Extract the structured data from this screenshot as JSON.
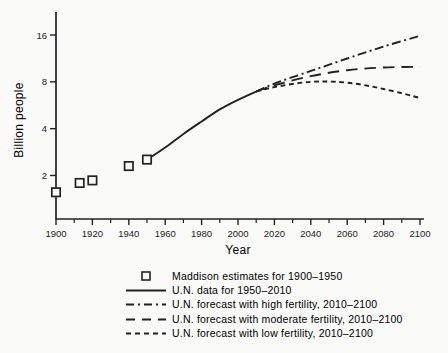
{
  "colors": {
    "background": "#fafaf8",
    "ink": "#222222"
  },
  "chart_data": {
    "type": "line",
    "title": "",
    "xlabel": "Year",
    "ylabel": "Billion people",
    "xlim": [
      1900,
      2100
    ],
    "ylim": [
      1.05,
      22.5
    ],
    "y_scale": "log2",
    "grid": false,
    "legend_position": "bottom",
    "x_ticks_major": [
      1900,
      1920,
      1940,
      1960,
      1980,
      2000,
      2020,
      2040,
      2060,
      2080,
      2100
    ],
    "x_ticks_minor": [
      1910,
      1930,
      1950,
      1970,
      1990,
      2010,
      2030,
      2050,
      2070,
      2090
    ],
    "y_ticks": [
      2,
      4,
      8,
      16
    ],
    "series": [
      {
        "name": "Maddison estimates for 1900–1950",
        "kind": "scatter",
        "marker": "open-square",
        "x": [
          1900,
          1913,
          1920,
          1940,
          1950
        ],
        "y": [
          1.56,
          1.79,
          1.86,
          2.3,
          2.53
        ]
      },
      {
        "name": "U.N. data for 1950–2010",
        "kind": "line",
        "style": "solid",
        "x": [
          1950,
          1960,
          1970,
          1980,
          1990,
          2000,
          2010
        ],
        "y": [
          2.53,
          3.03,
          3.7,
          4.45,
          5.32,
          6.13,
          6.93
        ]
      },
      {
        "name": "U.N. forecast with high fertility, 2010–2100",
        "kind": "line",
        "style": "dash-dot",
        "x": [
          2010,
          2020,
          2040,
          2060,
          2080,
          2100
        ],
        "y": [
          6.93,
          7.8,
          9.4,
          11.3,
          13.5,
          15.8
        ]
      },
      {
        "name": "U.N. forecast with moderate fertility, 2010–2100",
        "kind": "line",
        "style": "long-dash",
        "x": [
          2010,
          2020,
          2040,
          2060,
          2080,
          2100
        ],
        "y": [
          6.93,
          7.6,
          8.7,
          9.5,
          9.9,
          10.0
        ]
      },
      {
        "name": "U.N. forecast with low fertility, 2010–2100",
        "kind": "line",
        "style": "short-dash",
        "x": [
          2010,
          2020,
          2040,
          2060,
          2080,
          2100
        ],
        "y": [
          6.93,
          7.4,
          8.0,
          7.9,
          7.2,
          6.3
        ]
      }
    ]
  }
}
